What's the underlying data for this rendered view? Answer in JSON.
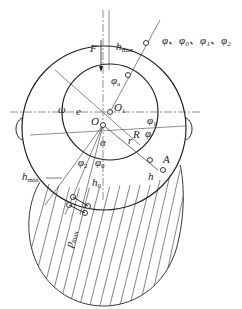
{
  "diagram": {
    "labels": {
      "F": "F",
      "h_max": "h",
      "h_max_sub": "max",
      "phi_list": "φ、φ₀、φ₁、φ₂",
      "phi_a": "φ",
      "phi_a_sub": "a",
      "omega": "ω",
      "e": "e",
      "O1": "O",
      "O1_sub": "1",
      "O": "O",
      "phi1": "φ",
      "phi1_sub": "1",
      "R": "R",
      "phi": "φ",
      "r": "r",
      "alpha": "α",
      "A": "A",
      "h": "h",
      "phi2": "φ",
      "phi2_sub": "2",
      "phi0": "φ",
      "phi0_sub": "0",
      "h_min": "h",
      "h_min_sub": "min",
      "h0": "h",
      "h0_sub": "0",
      "p_max": "p",
      "p_max_sub": "max"
    }
  }
}
